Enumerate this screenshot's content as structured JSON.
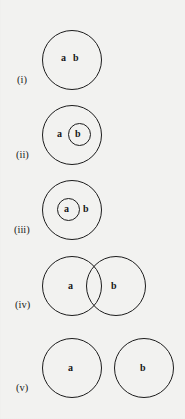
{
  "figure": {
    "type": "euler-venn-diagram-set",
    "background_color": "#f2f2f0",
    "stroke_color": "#1c1c1c",
    "text_color": "#171717",
    "width": 185,
    "height": 419,
    "rows": [
      {
        "id": "i",
        "label": "(i)",
        "description": "single circle containing both labels a and b",
        "label_x": 17,
        "label_y": 74,
        "circles": [
          {
            "name": "outer-circle",
            "x": 42,
            "y": 30,
            "d": 60,
            "kind": "outer"
          }
        ],
        "set_labels": [
          {
            "text": "a",
            "x": 61,
            "y": 53
          },
          {
            "text": "b",
            "x": 73,
            "y": 53
          }
        ]
      },
      {
        "id": "ii",
        "label": "(ii)",
        "description": "small circle b nested inside larger circle a",
        "label_x": 16,
        "label_y": 149,
        "circles": [
          {
            "name": "outer-circle-a",
            "x": 42,
            "y": 105,
            "d": 60,
            "kind": "outer"
          },
          {
            "name": "inner-circle-b",
            "x": 68,
            "y": 123,
            "d": 23,
            "kind": "inner"
          }
        ],
        "set_labels": [
          {
            "text": "a",
            "x": 57,
            "y": 129
          },
          {
            "text": "b",
            "x": 75,
            "y": 129
          }
        ]
      },
      {
        "id": "iii",
        "label": "(iii)",
        "description": "small circle a nested inside larger circle b",
        "label_x": 14,
        "label_y": 224,
        "circles": [
          {
            "name": "outer-circle-b",
            "x": 42,
            "y": 180,
            "d": 60,
            "kind": "outer"
          },
          {
            "name": "inner-circle-a",
            "x": 57,
            "y": 198,
            "d": 23,
            "kind": "inner"
          }
        ],
        "set_labels": [
          {
            "text": "a",
            "x": 64,
            "y": 204
          },
          {
            "text": "b",
            "x": 83,
            "y": 204
          }
        ]
      },
      {
        "id": "iv",
        "label": "(iv)",
        "description": "two overlapping circles a and b",
        "label_x": 15,
        "label_y": 299,
        "circles": [
          {
            "name": "circle-a",
            "x": 42,
            "y": 256,
            "d": 60,
            "kind": "outer"
          },
          {
            "name": "circle-b",
            "x": 86,
            "y": 256,
            "d": 60,
            "kind": "outer"
          }
        ],
        "set_labels": [
          {
            "text": "a",
            "x": 68,
            "y": 281
          },
          {
            "text": "b",
            "x": 111,
            "y": 281
          }
        ]
      },
      {
        "id": "v",
        "label": "(v)",
        "description": "two disjoint circles a and b",
        "label_x": 16,
        "label_y": 382,
        "circles": [
          {
            "name": "circle-a",
            "x": 42,
            "y": 338,
            "d": 60,
            "kind": "outer"
          },
          {
            "name": "circle-b",
            "x": 114,
            "y": 338,
            "d": 60,
            "kind": "outer"
          }
        ],
        "set_labels": [
          {
            "text": "a",
            "x": 68,
            "y": 363
          },
          {
            "text": "b",
            "x": 140,
            "y": 363
          }
        ]
      }
    ]
  }
}
